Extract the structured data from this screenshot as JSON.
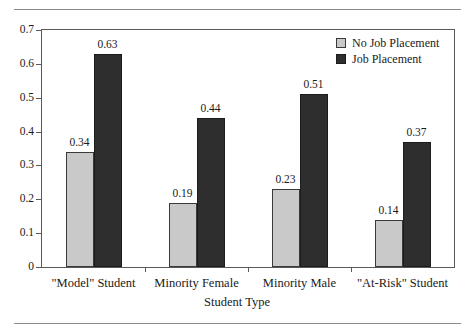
{
  "chart_data": {
    "type": "bar",
    "title": "",
    "subtitle": "",
    "xlabel": "Student Type",
    "ylabel": "",
    "ylim": [
      0,
      0.7
    ],
    "ytick_labels": [
      "0",
      "0.1",
      "0.2",
      "0.3",
      "0.4",
      "0.5",
      "0.6",
      "0.7"
    ],
    "ytick_values": [
      0,
      0.1,
      0.2,
      0.3,
      0.4,
      0.5,
      0.6,
      0.7
    ],
    "grid": false,
    "legend_position": "top-right",
    "categories": [
      "\"Model\" Student",
      "Minority Female",
      "Minority Male",
      "\"At-Risk\" Student"
    ],
    "series": [
      {
        "name": "No Job Placement",
        "color": "#c9c9c9",
        "values": [
          0.34,
          0.19,
          0.23,
          0.14
        ],
        "labels": [
          "0.34",
          "0.19",
          "0.23",
          "0.14"
        ]
      },
      {
        "name": "Job Placement",
        "color": "#2e2e2e",
        "values": [
          0.63,
          0.44,
          0.51,
          0.37
        ],
        "labels": [
          "0.63",
          "0.44",
          "0.51",
          "0.37"
        ]
      }
    ]
  },
  "figure": {
    "frame_color": "#595959",
    "rule_color": "#8a8a8a",
    "background": "#ffffff"
  }
}
